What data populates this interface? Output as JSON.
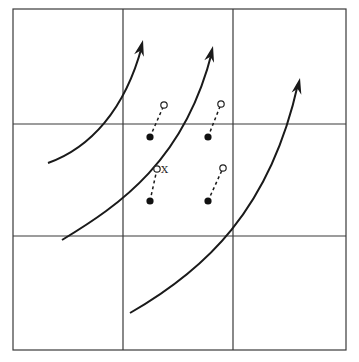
{
  "diagram": {
    "grid": {
      "rows": 3,
      "cols": 3,
      "x_lines": [
        13,
        123,
        233,
        346
      ],
      "y_lines": [
        9,
        124,
        236,
        350
      ]
    },
    "flow_arrows": [
      {
        "id": "arrow-1",
        "path": "M48,163 C90,148 125,110 142,46",
        "tip": [
          143,
          40
        ]
      },
      {
        "id": "arrow-2",
        "path": "M62,240 C120,205 185,160 212,52",
        "tip": [
          213,
          46
        ]
      },
      {
        "id": "arrow-3",
        "path": "M130,313 C205,270 270,210 298,84",
        "tip": [
          300,
          78
        ]
      }
    ],
    "displacements": [
      {
        "from": [
          150,
          137
        ],
        "to": [
          164,
          105
        ],
        "label": ""
      },
      {
        "from": [
          208,
          137
        ],
        "to": [
          221,
          104
        ],
        "label": ""
      },
      {
        "from": [
          150,
          201
        ],
        "to": [
          157,
          169
        ],
        "label": "X"
      },
      {
        "from": [
          208,
          201
        ],
        "to": [
          223,
          168
        ],
        "label": ""
      }
    ],
    "colors": {
      "ink": "#1a1a1a",
      "background": "#ffffff"
    }
  }
}
